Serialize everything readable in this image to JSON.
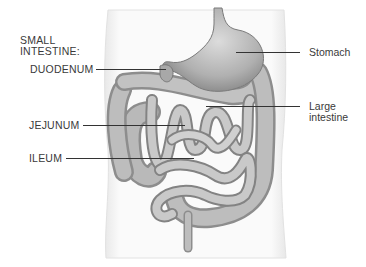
{
  "diagram": {
    "group_label": "SMALL\nINTESTINE:",
    "group_label_lines": [
      "SMALL",
      "INTESTINE:"
    ],
    "labels": {
      "duodenum": "DUODENUM",
      "jejunum": "JEJUNUM",
      "ileum": "ILEUM",
      "stomach": "Stomach",
      "large_intestine_line1": "Large",
      "large_intestine_line2": "intestine"
    },
    "colors": {
      "background": "#ffffff",
      "body_outline": "#e6e6e6",
      "organ_fill": "#b8b8b8",
      "organ_shade": "#8a8a8a",
      "organ_highlight": "#e2e2e2",
      "leader_line": "#333333",
      "text": "#3a3a3a"
    }
  }
}
